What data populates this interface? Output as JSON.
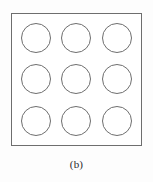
{
  "figure": {
    "caption": "(b)",
    "frame": {
      "shape": "square",
      "stroke_color": "#6e6e6e",
      "fill_color": "#ffffff"
    },
    "background_color": "#fdfdfd",
    "grid": {
      "rows": 3,
      "columns": 3,
      "count": 9,
      "element_shape": "circle",
      "element_stroke_color": "#6e6e6e",
      "element_fill_color": "transparent",
      "cells": [
        {
          "row": 1,
          "column": 1,
          "label": "circle-r1c1"
        },
        {
          "row": 1,
          "column": 2,
          "label": "circle-r1c2"
        },
        {
          "row": 1,
          "column": 3,
          "label": "circle-r1c3"
        },
        {
          "row": 2,
          "column": 1,
          "label": "circle-r2c1"
        },
        {
          "row": 2,
          "column": 2,
          "label": "circle-r2c2"
        },
        {
          "row": 2,
          "column": 3,
          "label": "circle-r2c3"
        },
        {
          "row": 3,
          "column": 1,
          "label": "circle-r3c1"
        },
        {
          "row": 3,
          "column": 2,
          "label": "circle-r3c2"
        },
        {
          "row": 3,
          "column": 3,
          "label": "circle-r3c3"
        }
      ]
    }
  }
}
